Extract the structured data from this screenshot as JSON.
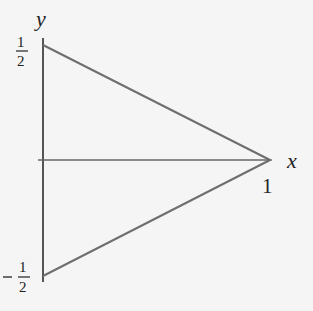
{
  "diagram": {
    "type": "triangle-on-axes",
    "axes": {
      "x_label": "x",
      "y_label": "y"
    },
    "ticks": {
      "x_one": "1",
      "y_half_num": "1",
      "y_half_den": "2",
      "y_neg_sign": "−",
      "y_neg_num": "1",
      "y_neg_den": "2"
    },
    "vertices": [
      {
        "name": "top",
        "x": 0,
        "y": 0.5
      },
      {
        "name": "right",
        "x": 1,
        "y": 0
      },
      {
        "name": "bottom",
        "x": 0,
        "y": -0.5
      }
    ],
    "colors": {
      "line": "#6e6e6e",
      "axis": "#555555",
      "text": "#222222",
      "background": "#f5f5f5"
    }
  }
}
